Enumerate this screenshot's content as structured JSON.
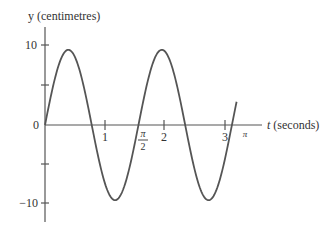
{
  "chart_data": {
    "type": "line",
    "title": "",
    "xlabel": "t (seconds)",
    "ylabel": "y (centimetres)",
    "x_tick_labels": [
      "1",
      "π/2",
      "2",
      "3",
      "π"
    ],
    "x_ticks": [
      1,
      1.5708,
      2,
      3,
      3.1416
    ],
    "y_tick_labels": [
      "10",
      "0",
      "−10"
    ],
    "y_ticks": [
      10,
      5,
      0,
      -5,
      -10
    ],
    "xlim": [
      0,
      3.3
    ],
    "ylim": [
      -12.5,
      12
    ],
    "grid": false,
    "legend": null,
    "series": [
      {
        "name": "y = 9.4 sin(4t)",
        "function": "9.4*sin(4*t)",
        "amplitude": 9.4,
        "angular_frequency": 4,
        "period": 1.5708,
        "t_start": 0,
        "t_end": 3.22,
        "sampled": {
          "t": [
            0,
            0.393,
            0.785,
            1.178,
            1.571,
            1.963,
            2.356,
            2.749,
            3.142,
            3.22
          ],
          "y": [
            0,
            9.4,
            0,
            -9.4,
            0,
            9.4,
            0,
            -9.4,
            0,
            2.9
          ]
        },
        "color": "#555555"
      }
    ]
  },
  "labels": {
    "y_axis": "y (centimetres)",
    "x_axis_var": "t",
    "x_axis_unit": "(seconds)",
    "y10": "10",
    "y0": "0",
    "yneg10": "−10",
    "x1": "1",
    "x2": "2",
    "x3": "3",
    "pi_num": "π",
    "pi_den": "2",
    "pi": "π"
  },
  "colors": {
    "axis": "#555555",
    "curve": "#555555",
    "text": "#333333"
  }
}
